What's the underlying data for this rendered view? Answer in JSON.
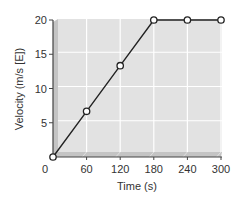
{
  "chart_data": {
    "type": "line",
    "title": "",
    "xlabel": "Time (s)",
    "ylabel": "Velocity (m/s [E])",
    "xlim": [
      0,
      300
    ],
    "ylim": [
      0,
      20
    ],
    "xticks": [
      0,
      60,
      120,
      180,
      240,
      300
    ],
    "yticks": [
      0,
      5,
      10,
      15,
      20
    ],
    "xtick_labels": [
      "0",
      "60",
      "120",
      "180",
      "240",
      "300"
    ],
    "ytick_labels": [
      "0",
      "5",
      "10",
      "15",
      "20"
    ],
    "grid": true,
    "legend": "none",
    "series": [
      {
        "name": "velocity",
        "x": [
          0,
          60,
          120,
          180,
          240,
          300
        ],
        "values": [
          0,
          6.67,
          13.33,
          20,
          20,
          20
        ],
        "marker": "open-circle"
      }
    ]
  },
  "colors": {
    "plot_face": "#e2e2e2",
    "plot_bevel": "#c4c4c4",
    "grid": "#ffffff",
    "axis": "#444444",
    "line": "#222222",
    "marker_fill": "#ffffff"
  }
}
